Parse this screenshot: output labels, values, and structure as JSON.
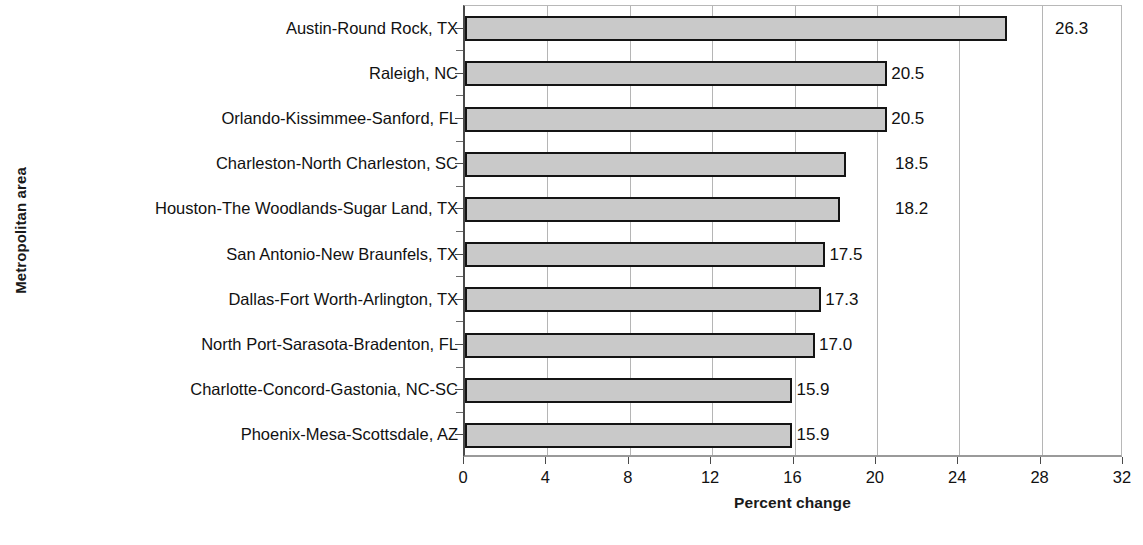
{
  "chart_data": {
    "type": "bar",
    "orientation": "horizontal",
    "title": "",
    "xlabel": "Percent change",
    "ylabel": "Metropolitan area",
    "xlim": [
      0,
      32
    ],
    "xticks": [
      0,
      4,
      8,
      12,
      16,
      20,
      24,
      28,
      32
    ],
    "xtick_labels": [
      "0",
      "4",
      "8",
      "12",
      "16",
      "20",
      "24",
      "28",
      "32"
    ],
    "grid": "vertical",
    "legend": "none",
    "categories": [
      "Austin-Round Rock, TX",
      "Raleigh, NC",
      "Orlando-Kissimmee-Sanford, FL",
      "Charleston-North Charleston, SC",
      "Houston-The Woodlands-Sugar Land, TX",
      "San Antonio-New Braunfels, TX",
      "Dallas-Fort Worth-Arlington, TX",
      "North Port-Sarasota-Bradenton, FL",
      "Charlotte-Concord-Gastonia, NC-SC",
      "Phoenix-Mesa-Scottsdale, AZ"
    ],
    "values": [
      26.3,
      20.5,
      20.5,
      18.5,
      18.2,
      17.5,
      17.3,
      17.0,
      15.9,
      15.9
    ],
    "data_labels": [
      "26.3",
      "20.5",
      "20.5",
      "18.5",
      "18.2",
      "17.5",
      "17.3",
      "17.0",
      "15.9",
      "15.9"
    ],
    "bar_fill_color": "#c9c9c9",
    "bar_border_color": "#141414",
    "gridline_color": "#b5b5b5"
  }
}
